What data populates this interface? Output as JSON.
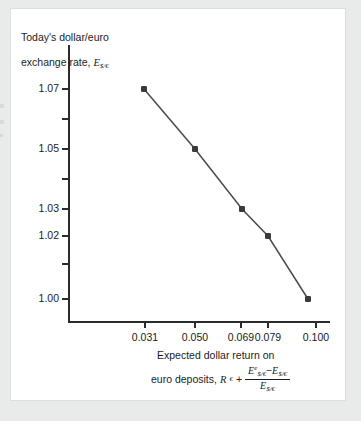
{
  "figure": {
    "background_color": "#e9eaea",
    "card_color": "#ffffff",
    "ink_color": "#2b2b2b"
  },
  "y_axis_title": {
    "line1": "Today's dollar/euro",
    "line2_prefix": "exchange rate, ",
    "symbol": "E",
    "symbol_sub": "$/€"
  },
  "x_axis_caption": {
    "line1": "Expected dollar return on",
    "line2_prefix": "euro deposits, ",
    "rate_symbol": "R",
    "rate_sub": "€",
    "plus": "+",
    "numerator_a": "E",
    "numerator_a_sup": "e",
    "numerator_a_sub": "$/€",
    "minus": "−",
    "numerator_b": "E",
    "numerator_b_sub": "$/€",
    "denominator": "E",
    "denominator_sub": "$/€"
  },
  "chart_data": {
    "type": "line",
    "title": "",
    "xlabel": "Expected dollar return on euro deposits, R€ + (Eᵉ$/€ − E$/€) / E$/€",
    "ylabel": "Today's dollar/euro exchange rate, E$/€",
    "x": [
      0.031,
      0.05,
      0.069,
      0.079,
      0.1
    ],
    "y": [
      1.07,
      1.05,
      1.03,
      1.02,
      1.0
    ],
    "xtick_labels": [
      "0.031",
      "0.050",
      "0.069",
      "0.079",
      "0.100"
    ],
    "ytick_labels": [
      "1.07",
      "1.05",
      "1.03",
      "1.02",
      "1.00"
    ],
    "ytick_minor_count": 4,
    "grid": false,
    "legend": null,
    "marker": "square",
    "marker_color": "#3a3a3a",
    "line_color": "#4a4a4a",
    "points": [
      {
        "x_label": "0.031",
        "y_label": "1.07",
        "px": 133,
        "py": 80
      },
      {
        "x_label": "0.050",
        "y_label": "1.05",
        "px": 184,
        "py": 140
      },
      {
        "x_label": "0.069",
        "y_label": "1.03",
        "px": 231,
        "py": 200
      },
      {
        "x_label": "0.079",
        "y_label": "1.02",
        "px": 257,
        "py": 227
      },
      {
        "x_label": "0.100",
        "y_label": "1.00",
        "px": 297,
        "py": 290
      }
    ]
  },
  "axis_geometry": {
    "ytick_px": [
      80,
      110,
      140,
      170,
      200,
      227,
      255,
      290
    ],
    "ytick_labeled": [
      "1.07",
      "",
      "1.05",
      "",
      "1.03",
      "1.02",
      "",
      "1.00"
    ],
    "xtick_px": [
      134,
      184,
      230,
      257,
      305
    ]
  }
}
